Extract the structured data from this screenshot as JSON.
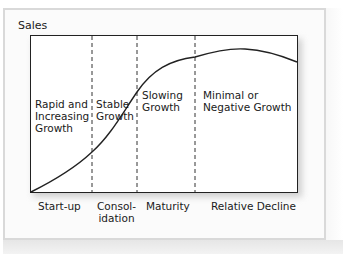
{
  "diagram": {
    "y_axis_label": "Sales",
    "stages": [
      {
        "phase": "Rapid and\nIncreasing\nGrowth",
        "label": "Start-up"
      },
      {
        "phase": "Stable\nGrowth",
        "label": "Consol-\nidation"
      },
      {
        "phase": "Slowing\nGrowth",
        "label": "Maturity"
      },
      {
        "phase": "Minimal or\nNegative Growth",
        "label": "Relative Decline"
      }
    ],
    "colors": {
      "line": "#222222",
      "frame": "#d9d9d9",
      "divider": "#333333"
    }
  }
}
